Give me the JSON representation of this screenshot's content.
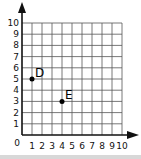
{
  "chart_data": {
    "type": "scatter",
    "title": "",
    "xlabel": "",
    "ylabel": "",
    "xlim": [
      0,
      10
    ],
    "ylim": [
      0,
      10
    ],
    "grid": true,
    "origin_label": "0",
    "x_ticks": [
      "1",
      "2",
      "3",
      "4",
      "5",
      "6",
      "7",
      "8",
      "9",
      "10"
    ],
    "y_ticks": [
      "1",
      "2",
      "3",
      "4",
      "5",
      "6",
      "7",
      "8",
      "9",
      "10"
    ],
    "points": [
      {
        "label": "D",
        "x": 1,
        "y": 5
      },
      {
        "label": "E",
        "x": 4,
        "y": 3
      }
    ],
    "legend": null
  },
  "colors": {
    "axis": "#111111",
    "grid": "#555555",
    "point": "#000000",
    "background": "#ffffff",
    "bottom_bar": "#d8d8d8"
  }
}
